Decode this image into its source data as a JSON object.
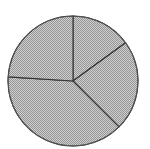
{
  "chart_data": {
    "type": "pie",
    "title": "",
    "start_angle_deg": 0,
    "direction": "clockwise",
    "categories": [
      "Slice 1",
      "Slice 2",
      "Slice 3",
      "Slice 4"
    ],
    "values": [
      15,
      22.5,
      38.5,
      24
    ],
    "legend": "none",
    "labels_shown": false,
    "center": [
      73,
      81
    ],
    "radius": 65
  },
  "style": {
    "fill_light": "#cfcfcf",
    "fill_dark": "#959595",
    "stroke": "#333333",
    "outline": "#555555",
    "background": "#ffffff"
  }
}
